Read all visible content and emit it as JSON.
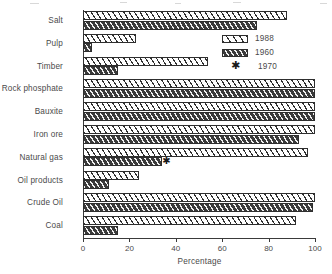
{
  "chart_data": {
    "type": "bar",
    "orientation": "horizontal",
    "title": "",
    "xlabel": "Percentage",
    "ylabel": "",
    "xlim": [
      0,
      100
    ],
    "xticks": [
      0,
      20,
      40,
      60,
      80,
      100
    ],
    "xtick_labels": [
      "0",
      "20",
      "40",
      "60",
      "80",
      "100"
    ],
    "grid": false,
    "legend_position": "upper right",
    "categories": [
      "Salt",
      "Pulp",
      "Timber",
      "Rock phosphate",
      "Bauxite",
      "Iron ore",
      "Natural gas",
      "Oil products",
      "Crude Oil",
      "Coal"
    ],
    "series": [
      {
        "name": "1988",
        "style": "light-diagonal-hatch",
        "values": [
          88,
          23,
          54,
          100,
          100,
          100,
          97,
          24,
          100,
          92
        ]
      },
      {
        "name": "1960",
        "style": "dark-diagonal-hatch",
        "values": [
          75,
          4,
          15,
          100,
          100,
          93,
          34,
          11,
          99,
          15
        ]
      },
      {
        "name": "1970",
        "style": "asterisk-marker",
        "values": [
          null,
          null,
          null,
          null,
          null,
          null,
          36,
          null,
          null,
          null
        ]
      }
    ],
    "legend": [
      {
        "label": "1988",
        "swatch": "light-diagonal-hatch"
      },
      {
        "label": "1960",
        "swatch": "dark-diagonal-hatch"
      },
      {
        "label": "1970",
        "swatch": "asterisk-marker"
      }
    ],
    "colors": {
      "bar_1988_fill": "#ffffff",
      "bar_1960_fill": "#4b4b4b",
      "hatch_line": "#2e2e2e",
      "axis": "#3a3a3a",
      "text": "#4a4a4a"
    }
  }
}
